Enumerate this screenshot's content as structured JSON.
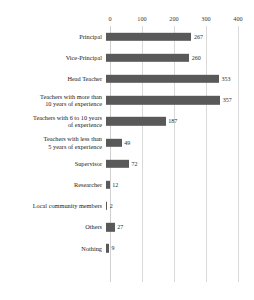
{
  "chart_data": {
    "type": "bar",
    "orientation": "horizontal",
    "title": "",
    "xlabel": "",
    "ylabel": "",
    "xlim": [
      0,
      400
    ],
    "xticks": [
      0,
      100,
      200,
      300,
      400
    ],
    "xtick_labels": [
      "0",
      "100",
      "200",
      "300",
      "400"
    ],
    "grid": true,
    "grid_axis": "x",
    "legend": false,
    "bar_color": "#595959",
    "grid_color": "#d9d9d9",
    "categories": [
      "Principal",
      "Vice-Principal",
      "Head Teacher",
      "Teachers with more than\n10 years of experience",
      "Teachers with 6 to 10 years\nof experience",
      "Teachers with less than\n5 years of experience",
      "Supervisor",
      "Researcher",
      "Local community members",
      "Others",
      "Nothing"
    ],
    "values": [
      267,
      260,
      353,
      357,
      187,
      49,
      72,
      12,
      2,
      27,
      9
    ],
    "value_labels": [
      "267",
      "260",
      "353",
      "357",
      "187",
      "49",
      "72",
      "12",
      "2",
      "27",
      "9"
    ]
  },
  "caption": {
    "text": ""
  }
}
